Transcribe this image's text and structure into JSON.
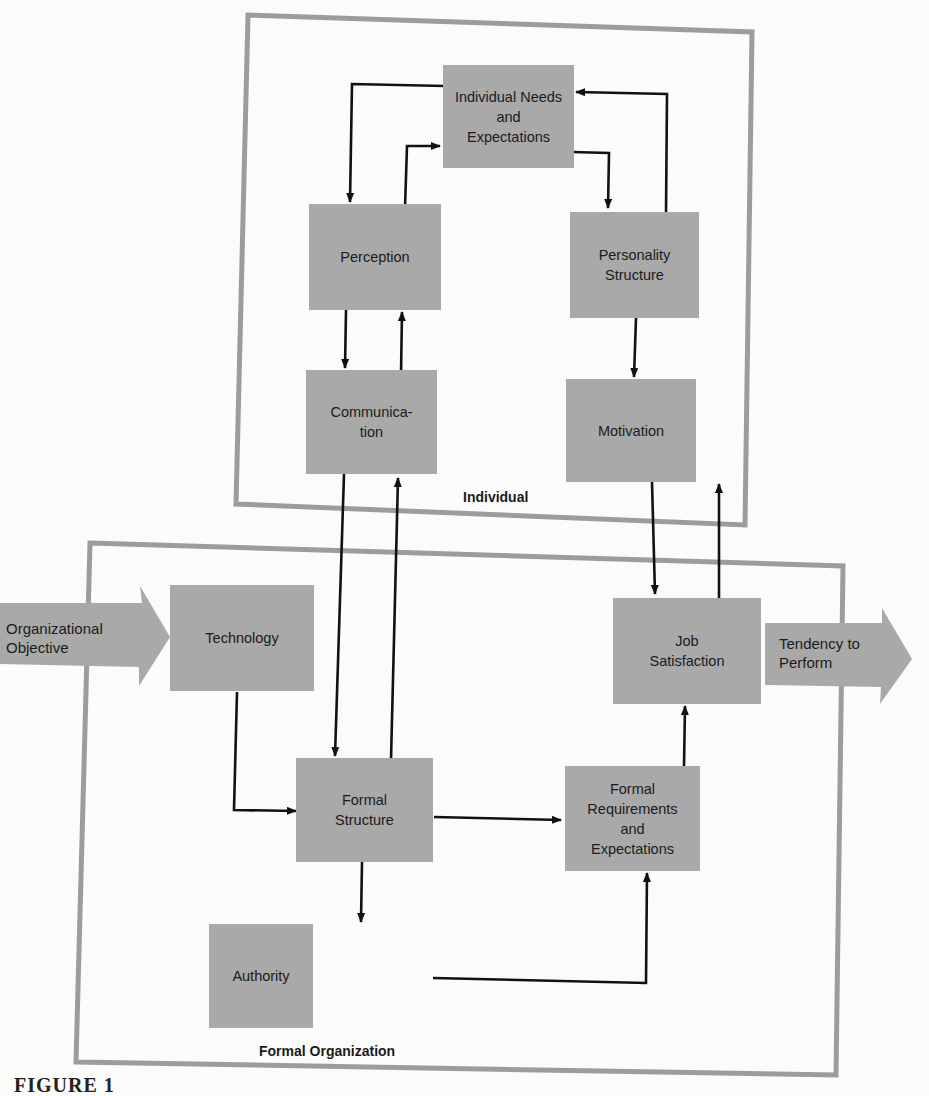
{
  "figure": {
    "caption_partial": "FIGURE 1",
    "colors": {
      "box_fill": "#a9a9a9",
      "frame": "#9c9c9c",
      "arrow": "#111111",
      "background": "#fbfbf9"
    }
  },
  "groups": {
    "individual": {
      "label": "Individual"
    },
    "formal_organization": {
      "label": "Formal Organization"
    }
  },
  "nodes": {
    "individual_needs": {
      "label": "Individual Needs\nand\nExpectations"
    },
    "perception": {
      "label": "Perception"
    },
    "personality_structure": {
      "label": "Personality\nStructure"
    },
    "communication": {
      "label": "Communica-\ntion"
    },
    "motivation": {
      "label": "Motivation"
    },
    "technology": {
      "label": "Technology"
    },
    "job_satisfaction": {
      "label": "Job\nSatisfaction"
    },
    "formal_structure": {
      "label": "Formal\nStructure"
    },
    "formal_requirements": {
      "label": "Formal\nRequirements\nand\nExpectations"
    },
    "authority": {
      "label": "Authority"
    }
  },
  "io_arrows": {
    "input": {
      "label": "Organizational\nObjective"
    },
    "output": {
      "label": "Tendency to\nPerform"
    }
  },
  "edges": [
    {
      "from": "Individual Needs and Expectations",
      "to": "Perception"
    },
    {
      "from": "Perception",
      "to": "Individual Needs and Expectations"
    },
    {
      "from": "Individual Needs and Expectations",
      "to": "Personality Structure"
    },
    {
      "from": "Personality Structure",
      "to": "Individual Needs and Expectations"
    },
    {
      "from": "Perception",
      "to": "Communication"
    },
    {
      "from": "Communication",
      "to": "Perception"
    },
    {
      "from": "Personality Structure",
      "to": "Motivation"
    },
    {
      "from": "Communication",
      "to": "Formal Structure"
    },
    {
      "from": "Formal Structure",
      "to": "Communication"
    },
    {
      "from": "Motivation",
      "to": "Job Satisfaction"
    },
    {
      "from": "Job Satisfaction",
      "to": "Motivation"
    },
    {
      "from": "Technology",
      "to": "Formal Structure"
    },
    {
      "from": "Formal Structure",
      "to": "Formal Requirements and Expectations"
    },
    {
      "from": "Formal Structure",
      "to": "Authority"
    },
    {
      "from": "Authority",
      "to": "Formal Requirements and Expectations"
    },
    {
      "from": "Formal Requirements and Expectations",
      "to": "Job Satisfaction"
    },
    {
      "from": "Organizational Objective",
      "to": "Technology"
    },
    {
      "from": "Job Satisfaction",
      "to": "Tendency to Perform"
    }
  ]
}
